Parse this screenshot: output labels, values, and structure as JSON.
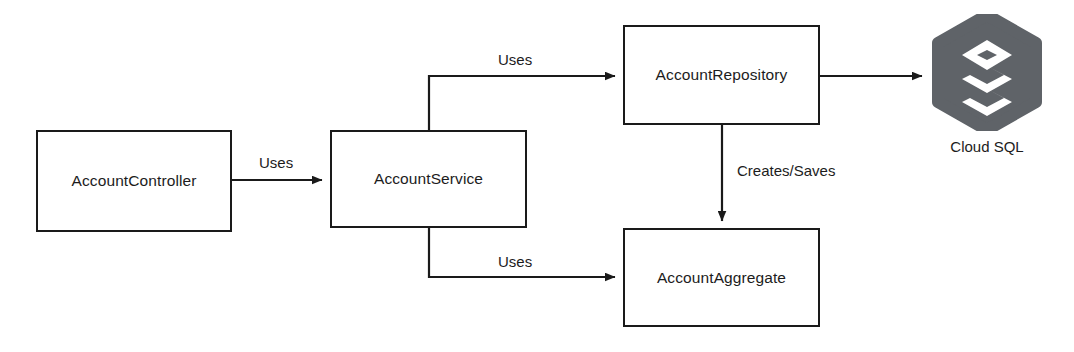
{
  "diagram": {
    "type": "architecture-flow-diagram",
    "background_color": "#ffffff",
    "stroke_color": "#1a1a1a",
    "text_color": "#1c1c1c",
    "nodes": [
      {
        "id": "account-controller",
        "label": "AccountController"
      },
      {
        "id": "account-service",
        "label": "AccountService"
      },
      {
        "id": "account-repository",
        "label": "AccountRepository"
      },
      {
        "id": "account-aggregate",
        "label": "AccountAggregate"
      }
    ],
    "cloud": {
      "id": "cloud-sql",
      "caption": "Cloud SQL",
      "icon": "cloud-sql-layers-icon",
      "hex_color": "#5f6368",
      "glyph_color": "#ffffff"
    },
    "edges": [
      {
        "id": "controller-to-service",
        "label": "Uses",
        "from": "account-controller",
        "to": "account-service"
      },
      {
        "id": "service-to-repository",
        "label": "Uses",
        "from": "account-service",
        "to": "account-repository"
      },
      {
        "id": "service-to-aggregate",
        "label": "Uses",
        "from": "account-service",
        "to": "account-aggregate"
      },
      {
        "id": "repository-to-aggregate",
        "label": "Creates/Saves",
        "from": "account-repository",
        "to": "account-aggregate"
      },
      {
        "id": "repository-to-cloudsql",
        "label": "",
        "from": "account-repository",
        "to": "cloud-sql"
      }
    ]
  }
}
